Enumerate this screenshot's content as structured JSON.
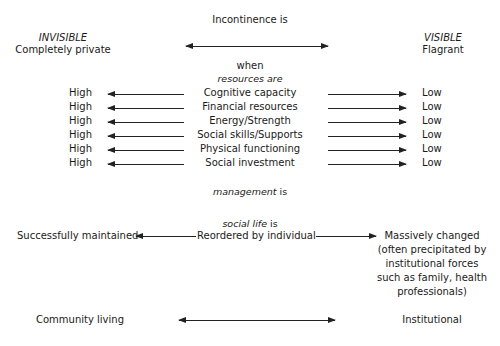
{
  "header": {
    "title": "Incontinence is",
    "left_label": "INVISIBLE",
    "left_sub": "Completely private",
    "right_label": "VISIBLE",
    "right_sub": "Flagrant"
  },
  "resources": {
    "intro_1": "when",
    "intro_2": "resources are",
    "left_value": "High",
    "right_value": "Low",
    "rows": [
      {
        "label": "Cognitive capacity",
        "left": "High",
        "right": "Low"
      },
      {
        "label": "Financial resources",
        "left": "High",
        "right": "Low"
      },
      {
        "label": "Energy/Strength",
        "left": "High",
        "right": "Low"
      },
      {
        "label": "Social skills/Supports",
        "left": "High",
        "right": "Low"
      },
      {
        "label": "Physical functioning",
        "left": "High",
        "right": "Low"
      },
      {
        "label": "Social investment",
        "left": "High",
        "right": "Low"
      }
    ]
  },
  "management": {
    "label_italic": "management",
    "label_rest": " is"
  },
  "social_life": {
    "label_italic": "social life",
    "label_rest": " is",
    "left": "Successfully maintained",
    "center": "Reordered by individual",
    "right_lines": [
      "Massively changed",
      "(often precipitated by",
      "institutional forces",
      "such as family, health",
      "professionals)"
    ]
  },
  "living": {
    "left": "Community living",
    "right": "Institutional"
  }
}
